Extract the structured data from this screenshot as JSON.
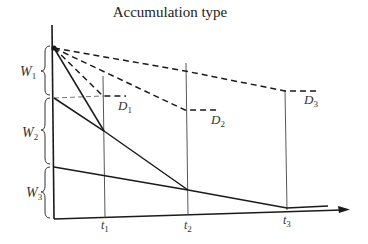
{
  "title": "Accumulation type",
  "labels": {
    "w1": "W",
    "w1_sub": "1",
    "w2": "W",
    "w2_sub": "2",
    "w3": "W",
    "w3_sub": "3",
    "d1": "D",
    "d1_sub": "1",
    "d2": "D",
    "d2_sub": "2",
    "d3": "D",
    "d3_sub": "3",
    "t1": "t",
    "t1_sub": "1",
    "t2": "t",
    "t2_sub": "2",
    "t3": "t",
    "t3_sub": "3"
  },
  "colors": {
    "line": "#1a1a1a",
    "thin": "#444444",
    "background": "#ffffff"
  }
}
